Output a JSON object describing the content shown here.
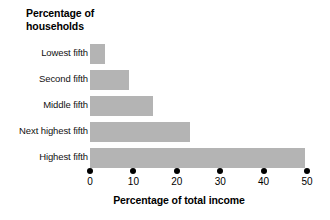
{
  "chart_data": {
    "type": "bar",
    "orientation": "horizontal",
    "title": "Percentage of\nhouseholds",
    "title_line1": "Percentage of",
    "title_line2": "households",
    "xlabel": "Percentage of total income",
    "ylabel": "Percentage of households",
    "categories": [
      "Lowest fifth",
      "Second fifth",
      "Middle fifth",
      "Next highest fifth",
      "Highest fifth"
    ],
    "values": [
      3.5,
      9,
      14.5,
      23,
      49.5
    ],
    "xlim": [
      0,
      50
    ],
    "xticks": [
      0,
      10,
      20,
      30,
      40,
      50
    ],
    "xtick_labels": [
      "0",
      "10",
      "20",
      "30",
      "40",
      "50"
    ],
    "grid": false,
    "legend": null,
    "bar_color": "#b4b4b4",
    "axis_color": "#000000",
    "background": "#ffffff",
    "bars": [
      {
        "label": "Lowest fifth",
        "value": 3.5
      },
      {
        "label": "Second fifth",
        "value": 9
      },
      {
        "label": "Middle fifth",
        "value": 14.5
      },
      {
        "label": "Next highest fifth",
        "value": 23
      },
      {
        "label": "Highest fifth",
        "value": 49.5
      }
    ]
  }
}
